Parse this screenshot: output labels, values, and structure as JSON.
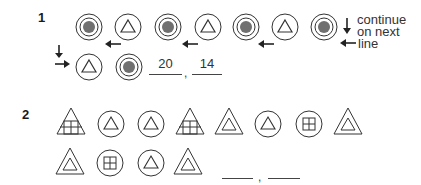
{
  "problems": [
    {
      "number": "1",
      "sequence_row1": [
        "filled-circle",
        "triangle-in-circle",
        "filled-circle",
        "triangle-in-circle",
        "filled-circle",
        "triangle-in-circle",
        "filled-circle"
      ],
      "sequence_row2": [
        "triangle-in-circle",
        "filled-circle"
      ],
      "note_lines": [
        "continue",
        "on next",
        "line"
      ],
      "answers": [
        "20",
        "14"
      ],
      "separator": ","
    },
    {
      "number": "2",
      "sequence_row1": [
        "grid-triangle",
        "triangle-in-circle",
        "triangle-in-circle",
        "grid-triangle",
        "double-triangle",
        "triangle-in-circle",
        "grid-circle",
        "double-triangle"
      ],
      "sequence_row2": [
        "double-triangle",
        "grid-circle",
        "triangle-in-circle",
        "double-triangle"
      ],
      "answers": [
        "",
        ""
      ],
      "separator": ","
    }
  ],
  "colors": {
    "stroke": "#333333",
    "fill_dot": "#707070"
  }
}
